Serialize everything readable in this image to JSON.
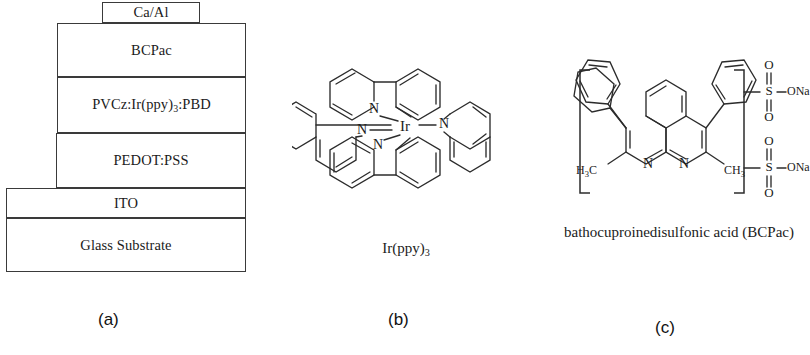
{
  "figure": {
    "panels": [
      {
        "id": "a",
        "letter": "(a)",
        "type": "device-stack-diagram",
        "layers": [
          {
            "name": "cathode",
            "label": "Ca/Al"
          },
          {
            "name": "electron-transport",
            "label": "BCPac"
          },
          {
            "name": "emissive-layer",
            "label_prefix": "PVCz:Ir(ppy)",
            "label_sub": "3",
            "label_suffix": ":PBD",
            "label_full": "PVCz:Ir(ppy)3:PBD"
          },
          {
            "name": "hole-injection",
            "label": "PEDOT:PSS"
          },
          {
            "name": "anode",
            "label": "ITO"
          },
          {
            "name": "substrate",
            "label": "Glass Substrate"
          }
        ]
      },
      {
        "id": "b",
        "letter": "(b)",
        "type": "chemical-structure",
        "caption_prefix": "Ir(ppy)",
        "caption_sub": "3",
        "caption_full": "Ir(ppy)3",
        "metal_center": "Ir",
        "nitrogen_label": "N",
        "ligand_count": 3,
        "ligand_name": "2-phenylpyridine"
      },
      {
        "id": "c",
        "letter": "(c)",
        "type": "chemical-structure",
        "caption": "bathocuproinedisulfonic acid (BCPac)",
        "nitrogen_label": "N",
        "sulfur_label": "S",
        "oxygen_label": "O",
        "sodium_salt_label": "ONa",
        "methyl_left_label": "H",
        "methyl_left_sub": "3",
        "methyl_left_suffix": "C",
        "methyl_left_full": "H3C",
        "methyl_right_label": "CH",
        "methyl_right_sub": "3",
        "methyl_right_full": "CH3",
        "sulfonate_count": 2
      }
    ]
  },
  "colors": {
    "background": "#ffffff",
    "line": "#2c2c2c",
    "text": "#1b1b1b",
    "stack_border": "#3a3a3a"
  }
}
